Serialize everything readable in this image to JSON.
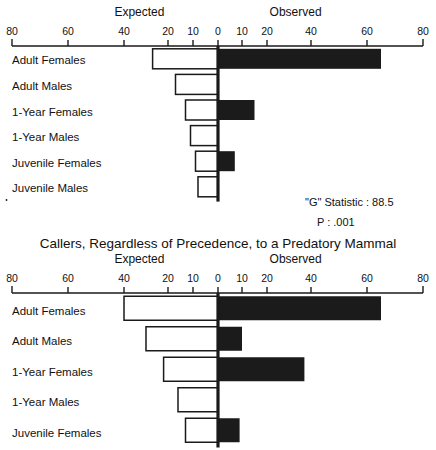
{
  "figure": {
    "panels": [
      {
        "id": "panel-top",
        "title": "",
        "headers": {
          "left": "Expected",
          "right": "Observed"
        },
        "tick_labels": [
          "80",
          "60",
          "40",
          "20",
          "10",
          "0",
          "10",
          "20",
          "40",
          "60",
          "80"
        ],
        "stats": {
          "g_label": "\"G\" Statistic : 88.5",
          "p_label": "P :  .001"
        },
        "rows": [
          {
            "label": "Adult Females",
            "expected": 27,
            "observed": 65
          },
          {
            "label": "Adult Males",
            "expected": 17,
            "observed": 0
          },
          {
            "label": "1-Year Females",
            "expected": 13,
            "observed": 15
          },
          {
            "label": "1-Year Males",
            "expected": 11,
            "observed": 0
          },
          {
            "label": "Juvenile Females",
            "expected": 9,
            "observed": 7
          },
          {
            "label": "Juvenile Males",
            "expected": 8,
            "observed": 0
          }
        ]
      },
      {
        "id": "panel-bottom",
        "title": "Callers, Regardless of Precedence, to a Predatory Mammal",
        "headers": {
          "left": "Expected",
          "right": "Observed"
        },
        "tick_labels": [
          "80",
          "60",
          "40",
          "20",
          "10",
          "0",
          "10",
          "20",
          "40",
          "60",
          "80"
        ],
        "stats": {
          "g_label": "",
          "p_label": ""
        },
        "rows": [
          {
            "label": "Adult Females",
            "expected": 40,
            "observed": 65
          },
          {
            "label": "Adult Males",
            "expected": 30,
            "observed": 10
          },
          {
            "label": "1-Year Females",
            "expected": 22,
            "observed": 37
          },
          {
            "label": "1-Year Males",
            "expected": 16,
            "observed": 0
          },
          {
            "label": "Juvenile Females",
            "expected": 13,
            "observed": 9
          }
        ]
      }
    ]
  },
  "chart_data": {
    "type": "bar",
    "title": "Callers, Regardless of Precedence, to a Predatory Mammal",
    "subtitle": "",
    "orientation": "horizontal-diverging",
    "xlabel": "",
    "ylabel": "",
    "axis_note": "Non-linear piecewise axis: 0-20 expanded, 20-80 compressed; mirrored about 0",
    "axis_ticks": [
      -80,
      -60,
      -40,
      -20,
      -10,
      0,
      10,
      20,
      40,
      60,
      80
    ],
    "axis_tick_labels": [
      "80",
      "60",
      "40",
      "20",
      "10",
      "0",
      "10",
      "20",
      "40",
      "60",
      "80"
    ],
    "legend": [
      "Expected",
      "Observed"
    ],
    "legend_position": "top",
    "grid": false,
    "charts": [
      {
        "name": "Upper panel",
        "title": "",
        "annotations": [
          "\"G\" Statistic : 88.5",
          "P :  .001"
        ],
        "categories": [
          "Adult Females",
          "Adult Males",
          "1-Year Females",
          "1-Year Males",
          "Juvenile Females",
          "Juvenile Males"
        ],
        "series": [
          {
            "name": "Expected",
            "values": [
              27,
              17,
              13,
              11,
              9,
              8
            ]
          },
          {
            "name": "Observed",
            "values": [
              65,
              0,
              15,
              0,
              7,
              0
            ]
          }
        ]
      },
      {
        "name": "Lower panel",
        "title": "Callers, Regardless of Precedence, to a Predatory Mammal",
        "annotations": [],
        "categories": [
          "Adult Females",
          "Adult Males",
          "1-Year Females",
          "1-Year Males",
          "Juvenile Females"
        ],
        "series": [
          {
            "name": "Expected",
            "values": [
              40,
              30,
              22,
              16,
              13
            ]
          },
          {
            "name": "Observed",
            "values": [
              65,
              10,
              37,
              0,
              9
            ]
          }
        ]
      }
    ]
  },
  "colors": {
    "ink": "#1a1a1a",
    "observed_fill": "#1b1b1b",
    "expected_fill": "#ffffff",
    "background": "#ffffff"
  }
}
